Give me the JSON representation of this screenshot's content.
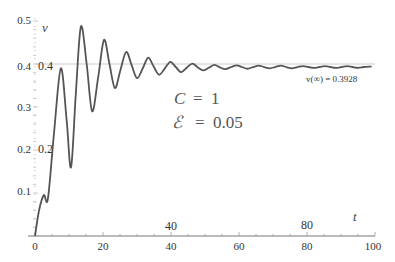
{
  "chart_data": {
    "type": "line",
    "title": "",
    "xlabel": "t",
    "ylabel": "v",
    "xlim": [
      0,
      100
    ],
    "ylim": [
      0,
      0.5
    ],
    "grid": false,
    "x_ticks": [
      0,
      20,
      40,
      60,
      80,
      100
    ],
    "y_ticks": [
      0.1,
      0.2,
      0.3,
      0.4,
      0.5
    ],
    "inner_x_labels": [
      "40",
      "80"
    ],
    "inner_y_labels": [
      "0.2",
      "0.4"
    ],
    "reference_line": {
      "y": 0.4,
      "color": "#cccccc"
    },
    "series": [
      {
        "name": "v(t)",
        "color": "#555555",
        "x": [
          0,
          1.2,
          2.6,
          3.8,
          5.6,
          7.6,
          9.3,
          10.6,
          12.0,
          13.5,
          15.2,
          16.8,
          18.6,
          20.3,
          21.9,
          23.5,
          25.1,
          26.8,
          28.4,
          30.0,
          31.7,
          33.3,
          34.9,
          36.5,
          38.2,
          39.8,
          41.4,
          43.0,
          44.7,
          46.3,
          47.9,
          49.5,
          51.2,
          52.8,
          54.4,
          56.0,
          57.7,
          59.3,
          60.9,
          62.5,
          64.2,
          65.8,
          67.4,
          69.0,
          70.7,
          72.3,
          73.9,
          75.5,
          77.2,
          78.8,
          80.4,
          82.0,
          83.7,
          85.3,
          86.9,
          88.5,
          90.2,
          91.8,
          93.4,
          95.0,
          96.7,
          98.3,
          99.0
        ],
        "values": [
          0,
          0.06,
          0.095,
          0.087,
          0.24,
          0.39,
          0.27,
          0.16,
          0.33,
          0.487,
          0.4,
          0.29,
          0.37,
          0.456,
          0.4,
          0.344,
          0.385,
          0.428,
          0.398,
          0.367,
          0.39,
          0.415,
          0.394,
          0.375,
          0.39,
          0.405,
          0.393,
          0.381,
          0.392,
          0.401,
          0.392,
          0.385,
          0.392,
          0.398,
          0.392,
          0.388,
          0.393,
          0.397,
          0.393,
          0.389,
          0.393,
          0.396,
          0.393,
          0.39,
          0.393,
          0.396,
          0.393,
          0.39,
          0.393,
          0.395,
          0.393,
          0.391,
          0.393,
          0.395,
          0.393,
          0.391,
          0.393,
          0.395,
          0.393,
          0.391,
          0.393,
          0.394,
          0.394
        ]
      }
    ],
    "annotations": [
      {
        "text": "v(∞) = 0.3928",
        "x": 88,
        "y": 0.375
      },
      {
        "text": "C  =  1",
        "x": 40,
        "y": 0.33
      },
      {
        "text": "ℰ  =  0.05",
        "x": 40,
        "y": 0.28
      }
    ]
  },
  "labels": {
    "x_axis_name": "t",
    "y_axis_name": "v",
    "x_ticks": [
      "0",
      "20",
      "40",
      "60",
      "80",
      "100"
    ],
    "y_ticks": [
      "0.1",
      "0.2",
      "0.3",
      "0.4",
      "0.5"
    ],
    "inner_x": [
      "40",
      "80"
    ],
    "inner_y": [
      "0.2",
      "0.4"
    ],
    "asymptote": "v(∞) = 0.3928",
    "param_c_sym": "C",
    "param_c_eq": "=  1",
    "param_e_sym": "ℰ",
    "param_e_eq": "=  0.05"
  }
}
